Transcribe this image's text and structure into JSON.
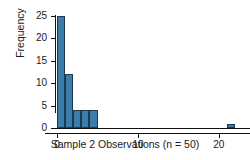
{
  "chart_data": {
    "type": "bar",
    "subtype": "histogram",
    "title": "",
    "xlabel": "Sample 2 Observations (n = 50)",
    "ylabel": "Frequency",
    "xlim": [
      -1.5,
      23.0
    ],
    "ylim": [
      0,
      25
    ],
    "grid": false,
    "legend": null,
    "bar_color": "#3C7CA8",
    "bar_edge_color": "#1b3a52",
    "axis_color": "#111111",
    "bin_width": 1,
    "bins": [
      {
        "x_start": 0,
        "x_end": 1,
        "count": 25
      },
      {
        "x_start": 1,
        "x_end": 2,
        "count": 12
      },
      {
        "x_start": 2,
        "x_end": 3,
        "count": 4
      },
      {
        "x_start": 3,
        "x_end": 4,
        "count": 4
      },
      {
        "x_start": 4,
        "x_end": 5,
        "count": 4
      },
      {
        "x_start": 21,
        "x_end": 22,
        "count": 1
      }
    ],
    "categories": [
      "0-1",
      "1-2",
      "2-3",
      "3-4",
      "4-5",
      "21-22"
    ],
    "values": [
      25,
      12,
      4,
      4,
      4,
      1
    ],
    "total_count": 50,
    "xticks": [
      0,
      10,
      20
    ],
    "xticklabels": [
      "0",
      "10",
      "20"
    ],
    "yticks": [
      0,
      5,
      10,
      15,
      20,
      25
    ],
    "yticklabels": [
      "0",
      "5",
      "10",
      "15",
      "20",
      "25"
    ]
  }
}
